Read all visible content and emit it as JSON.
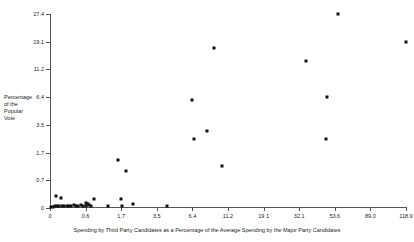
{
  "chart_data": {
    "type": "scatter",
    "title": "",
    "xlabel": "Spending by Third Party Candidates as a Percentage of the Average Spending by the Major Party Candidates",
    "ylabel": "Percentage of the Popular Vote",
    "ylabel_lines": [
      "Percentage",
      "of the",
      "Popular",
      "Vote"
    ],
    "grid": false,
    "legend": null,
    "x_scale": "transformed-even-spaced",
    "y_scale": "transformed-even-spaced",
    "xticks": [
      "0",
      "0.6",
      "1.7",
      "3.5",
      "6.4",
      "11.2",
      "19.1",
      "32.1",
      "53.6",
      "89.0",
      "118.9"
    ],
    "xtick_values": [
      0,
      0.6,
      1.7,
      3.5,
      6.4,
      11.2,
      19.1,
      32.1,
      53.6,
      89.0,
      118.9
    ],
    "yticks": [
      "0",
      "0.7",
      "1.7",
      "3.5",
      "6.4",
      "11.2",
      "19.1",
      "27.4"
    ],
    "ytick_values": [
      0,
      0.7,
      1.7,
      3.5,
      6.4,
      11.2,
      19.1,
      27.4
    ],
    "xlim": [
      0,
      118.9
    ],
    "ylim": [
      0,
      27.4
    ],
    "marker": "square",
    "marker_color": "#111111",
    "points": [
      {
        "x": 0.02,
        "y": 0.02
      },
      {
        "x": 0.05,
        "y": 0.03
      },
      {
        "x": 0.08,
        "y": 0.05
      },
      {
        "x": 0.1,
        "y": 0.3
      },
      {
        "x": 0.12,
        "y": 0.04
      },
      {
        "x": 0.15,
        "y": 0.05
      },
      {
        "x": 0.18,
        "y": 0.24
      },
      {
        "x": 0.2,
        "y": 0.06
      },
      {
        "x": 0.24,
        "y": 0.05
      },
      {
        "x": 0.28,
        "y": 0.04
      },
      {
        "x": 0.32,
        "y": 0.06
      },
      {
        "x": 0.36,
        "y": 0.05
      },
      {
        "x": 0.4,
        "y": 0.07
      },
      {
        "x": 0.44,
        "y": 0.05
      },
      {
        "x": 0.48,
        "y": 0.06
      },
      {
        "x": 0.52,
        "y": 0.08
      },
      {
        "x": 0.56,
        "y": 0.06
      },
      {
        "x": 0.6,
        "y": 0.12
      },
      {
        "x": 0.62,
        "y": 0.05
      },
      {
        "x": 0.66,
        "y": 0.1
      },
      {
        "x": 0.7,
        "y": 0.08
      },
      {
        "x": 0.78,
        "y": 0.05
      },
      {
        "x": 0.85,
        "y": 0.22
      },
      {
        "x": 1.3,
        "y": 0.06
      },
      {
        "x": 1.6,
        "y": 1.45
      },
      {
        "x": 1.7,
        "y": 0.22
      },
      {
        "x": 1.72,
        "y": 0.05
      },
      {
        "x": 1.95,
        "y": 1.05
      },
      {
        "x": 2.3,
        "y": 0.09
      },
      {
        "x": 4.3,
        "y": 0.05
      },
      {
        "x": 6.4,
        "y": 6.1
      },
      {
        "x": 6.6,
        "y": 2.6
      },
      {
        "x": 8.4,
        "y": 3.1
      },
      {
        "x": 9.3,
        "y": 17.2
      },
      {
        "x": 10.4,
        "y": 1.2
      },
      {
        "x": 36.0,
        "y": 13.6
      },
      {
        "x": 48.0,
        "y": 2.6
      },
      {
        "x": 49.0,
        "y": 6.5
      },
      {
        "x": 57.0,
        "y": 27.4
      },
      {
        "x": 118.9,
        "y": 19.1
      }
    ]
  }
}
